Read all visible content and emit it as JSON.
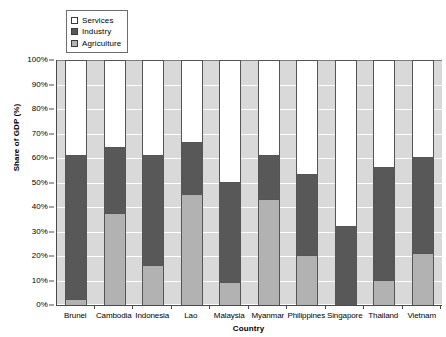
{
  "chart_data": {
    "type": "bar",
    "subtype": "stacked-100-percent",
    "title": "",
    "xlabel": "Country",
    "ylabel": "Share of GDP (%)",
    "ylim": [
      0,
      100
    ],
    "ytick_labels": [
      "100%",
      "90%",
      "80%",
      "70%",
      "60%",
      "50%",
      "40%",
      "30%",
      "20%",
      "10%",
      "0%"
    ],
    "ytick_values": [
      100,
      90,
      80,
      70,
      60,
      50,
      40,
      30,
      20,
      10,
      0
    ],
    "grid": true,
    "legend_position": "top-left",
    "categories": [
      "Brunei",
      "Cambodia",
      "Indonesia",
      "Lao",
      "Malaysia",
      "Myanmar",
      "Philippines",
      "Singapore",
      "Thailand",
      "Vietnam"
    ],
    "series": [
      {
        "name": "Agriculture",
        "color": "#b2b2b2",
        "values": [
          2,
          37,
          16,
          45,
          9,
          43,
          20,
          0,
          10,
          21
        ]
      },
      {
        "name": "Industry",
        "color": "#585858",
        "values": [
          59,
          27,
          45,
          21,
          41,
          18,
          33,
          32,
          46,
          39
        ]
      },
      {
        "name": "Services",
        "color": "#ffffff",
        "values": [
          39,
          36,
          39,
          34,
          50,
          39,
          47,
          68,
          44,
          40
        ]
      }
    ],
    "cumulative_tops": {
      "agriculture": [
        2,
        37,
        16,
        45,
        9,
        43,
        20,
        0,
        10,
        21
      ],
      "industry": [
        61,
        64,
        61,
        66,
        50,
        61,
        53,
        32,
        56,
        60
      ],
      "services": [
        100,
        100,
        100,
        100,
        100,
        100,
        100,
        100,
        100,
        100
      ]
    }
  },
  "legend": {
    "items": [
      {
        "label": "Services",
        "color": "#ffffff"
      },
      {
        "label": "Industry",
        "color": "#585858"
      },
      {
        "label": "Agriculture",
        "color": "#b2b2b2"
      }
    ]
  },
  "axes": {
    "y_title": "Share of GDP (%)",
    "x_title": "Country"
  }
}
